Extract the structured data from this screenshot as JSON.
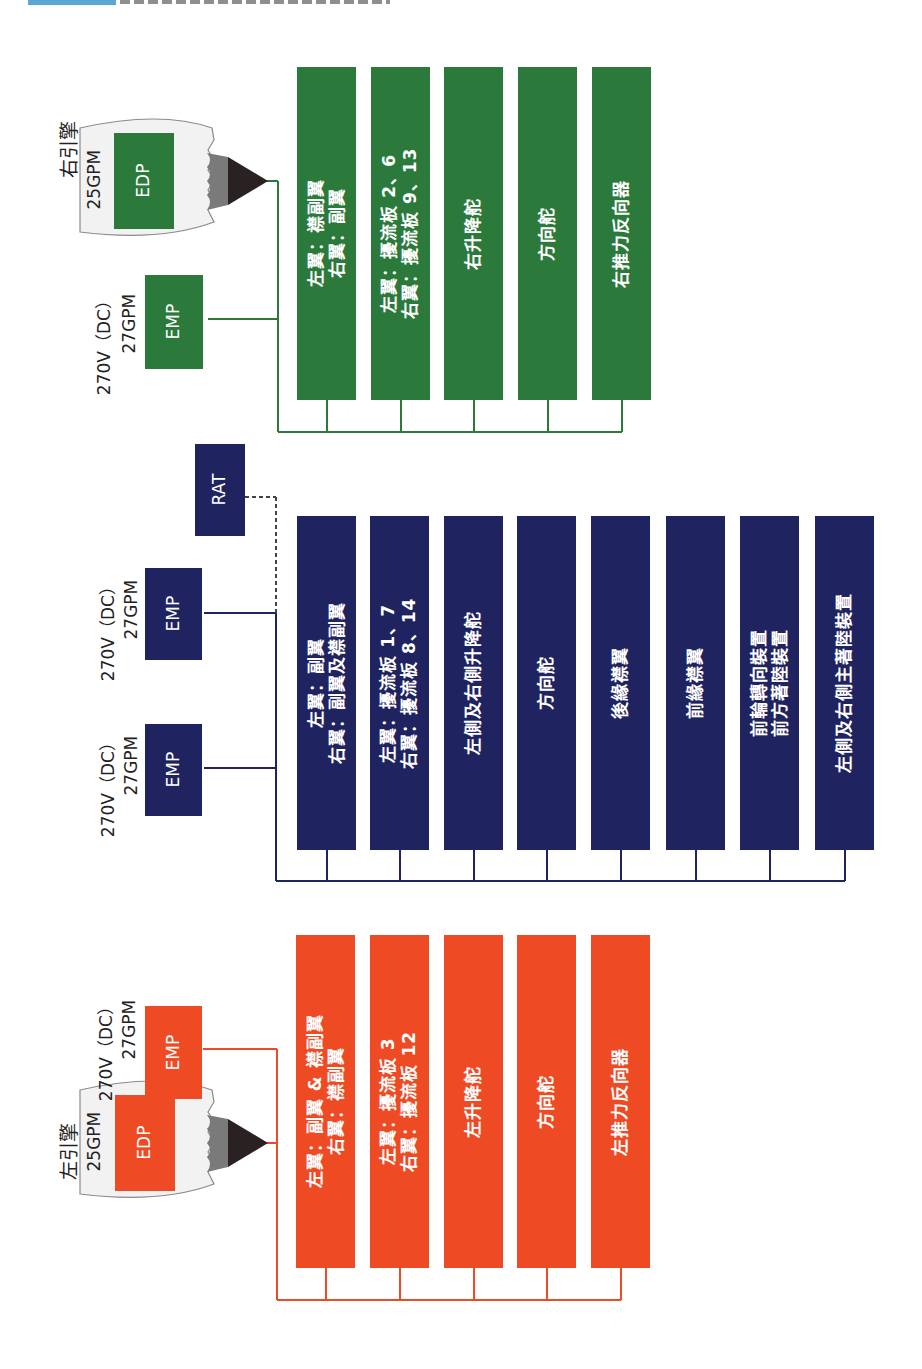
{
  "header": {
    "clipped": true
  },
  "colors": {
    "right_system": "#2b7a3c",
    "center_system": "#1f2460",
    "left_system": "#ee4b24",
    "nacelle_fill": "#f2f2f2",
    "nacelle_stroke": "#888888"
  },
  "right_system": {
    "engine_label": "右引擎",
    "edp_flow": "25GPM",
    "edp_label": "EDP",
    "emp_voltage": "270V（DC）",
    "emp_flow": "27GPM",
    "emp_label": "EMP",
    "consumers": [
      {
        "lines": [
          "左翼：襟副翼",
          "右翼：副翼"
        ]
      },
      {
        "lines": [
          "左翼：擾流板 2、6",
          "右翼：擾流板 9、13"
        ]
      },
      {
        "lines": [
          "右升降舵"
        ]
      },
      {
        "lines": [
          "方向舵"
        ]
      },
      {
        "lines": [
          "右推力反向器"
        ]
      }
    ]
  },
  "center_system": {
    "pumps": [
      {
        "voltage": "270V（DC）",
        "flow": "27GPM",
        "label": "EMP"
      },
      {
        "voltage": "270V（DC）",
        "flow": "27GPM",
        "label": "EMP"
      }
    ],
    "rat": {
      "flow": "13GPM",
      "label": "RAT"
    },
    "consumers": [
      {
        "lines": [
          "左翼：副翼",
          "右翼：副翼及襟副翼"
        ]
      },
      {
        "lines": [
          "左翼：擾流板 1、7",
          "右翼：擾流板 8、14"
        ]
      },
      {
        "lines": [
          "左側及右側升降舵"
        ]
      },
      {
        "lines": [
          "方向舵"
        ]
      },
      {
        "lines": [
          "後緣襟翼"
        ]
      },
      {
        "lines": [
          "前緣襟翼"
        ]
      },
      {
        "lines": [
          "前輪轉向裝置",
          "前方著陸裝置"
        ]
      },
      {
        "lines": [
          "左側及右側主著陸裝置"
        ]
      }
    ]
  },
  "left_system": {
    "engine_label": "左引擎",
    "edp_flow": "25GPM",
    "edp_label": "EDP",
    "emp_voltage": "270V（DC）",
    "emp_flow": "27GPM",
    "emp_label": "EMP",
    "consumers": [
      {
        "lines": [
          "左翼：副翼 & 襟副翼",
          "右翼：襟副翼"
        ]
      },
      {
        "lines": [
          "左翼：擾流板 3",
          "右翼：擾流板 12"
        ]
      },
      {
        "lines": [
          "左升降舵"
        ]
      },
      {
        "lines": [
          "方向舵"
        ]
      },
      {
        "lines": [
          "左推力反向器"
        ]
      }
    ]
  }
}
